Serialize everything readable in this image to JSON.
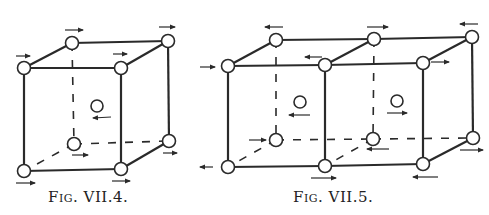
{
  "figures": [
    {
      "id": "fig-vii-4",
      "caption": "Fig. VII.4.",
      "caption_pos": [
        48,
        188
      ],
      "nodes": {
        "ftl": [
          24,
          68
        ],
        "ftr": [
          121,
          68
        ],
        "fbl": [
          24,
          171
        ],
        "fbr": [
          121,
          169
        ],
        "btl": [
          72,
          43
        ],
        "btr": [
          168,
          41
        ],
        "bbl": [
          74,
          144
        ],
        "bbr": [
          169,
          141
        ]
      },
      "center": [
        97,
        106
      ],
      "solid_edges": [
        [
          "ftl",
          "ftr"
        ],
        [
          "ftr",
          "fbr"
        ],
        [
          "fbr",
          "fbl"
        ],
        [
          "fbl",
          "ftl"
        ],
        [
          "ftl",
          "btl"
        ],
        [
          "btl",
          "btr"
        ],
        [
          "btr",
          "ftr"
        ],
        [
          "btr",
          "bbr"
        ],
        [
          "bbr",
          "fbr"
        ]
      ],
      "dashed_edges": [
        [
          "btl",
          "bbl"
        ],
        [
          "bbl",
          "bbr"
        ],
        [
          "bbl",
          "fbl"
        ]
      ],
      "arrows": [
        {
          "x1": 65,
          "y1": 30,
          "x2": 83,
          "y2": 30,
          "dir": "right"
        },
        {
          "x1": 16,
          "y1": 56,
          "x2": 30,
          "y2": 56,
          "dir": "right"
        },
        {
          "x1": 113,
          "y1": 54,
          "x2": 127,
          "y2": 54,
          "dir": "right"
        },
        {
          "x1": 159,
          "y1": 27,
          "x2": 175,
          "y2": 27,
          "dir": "right"
        },
        {
          "x1": 111,
          "y1": 117,
          "x2": 93,
          "y2": 118,
          "dir": "left"
        },
        {
          "x1": 72,
          "y1": 155,
          "x2": 88,
          "y2": 155,
          "dir": "right"
        },
        {
          "x1": 16,
          "y1": 183,
          "x2": 35,
          "y2": 183,
          "dir": "right"
        },
        {
          "x1": 112,
          "y1": 181,
          "x2": 130,
          "y2": 181,
          "dir": "right"
        },
        {
          "x1": 163,
          "y1": 153,
          "x2": 177,
          "y2": 153,
          "dir": "right"
        }
      ]
    },
    {
      "id": "fig-vii-5",
      "caption": "Fig. VII.5.",
      "caption_pos": [
        293,
        188
      ],
      "nodes": {
        "ftl": [
          228,
          66
        ],
        "ftm": [
          325,
          65
        ],
        "ftr": [
          423,
          63
        ],
        "fbl": [
          228,
          167
        ],
        "fbm": [
          325,
          166
        ],
        "fbr": [
          423,
          164
        ],
        "btl": [
          276,
          40
        ],
        "btm": [
          374,
          39
        ],
        "btr": [
          472,
          37
        ],
        "bbl": [
          276,
          140
        ],
        "bbm": [
          373,
          139
        ],
        "bbr": [
          473,
          138
        ]
      },
      "centers": [
        [
          300,
          102
        ],
        [
          397,
          101
        ]
      ],
      "solid_edges": [
        [
          "ftl",
          "ftm"
        ],
        [
          "ftm",
          "ftr"
        ],
        [
          "fbl",
          "fbm"
        ],
        [
          "fbm",
          "fbr"
        ],
        [
          "ftl",
          "fbl"
        ],
        [
          "ftm",
          "fbm"
        ],
        [
          "ftr",
          "fbr"
        ],
        [
          "ftl",
          "btl"
        ],
        [
          "ftm",
          "btm"
        ],
        [
          "ftr",
          "btr"
        ],
        [
          "btl",
          "btm"
        ],
        [
          "btm",
          "btr"
        ],
        [
          "btr",
          "bbr"
        ],
        [
          "bbr",
          "fbr"
        ]
      ],
      "dashed_edges": [
        [
          "btl",
          "bbl"
        ],
        [
          "btm",
          "bbm"
        ],
        [
          "bbl",
          "bbm"
        ],
        [
          "bbm",
          "bbr"
        ],
        [
          "bbl",
          "fbl"
        ],
        [
          "bbm",
          "fbm"
        ]
      ],
      "arrows": [
        {
          "x1": 283,
          "y1": 27,
          "x2": 265,
          "y2": 27,
          "dir": "left"
        },
        {
          "x1": 200,
          "y1": 67,
          "x2": 215,
          "y2": 67,
          "dir": "right"
        },
        {
          "x1": 322,
          "y1": 57,
          "x2": 305,
          "y2": 57,
          "dir": "left"
        },
        {
          "x1": 367,
          "y1": 27,
          "x2": 388,
          "y2": 27,
          "dir": "right"
        },
        {
          "x1": 478,
          "y1": 24,
          "x2": 460,
          "y2": 24,
          "dir": "left"
        },
        {
          "x1": 431,
          "y1": 62,
          "x2": 449,
          "y2": 62,
          "dir": "right"
        },
        {
          "x1": 310,
          "y1": 115,
          "x2": 289,
          "y2": 115,
          "dir": "left"
        },
        {
          "x1": 387,
          "y1": 113,
          "x2": 407,
          "y2": 113,
          "dir": "right"
        },
        {
          "x1": 249,
          "y1": 140,
          "x2": 266,
          "y2": 140,
          "dir": "right"
        },
        {
          "x1": 213,
          "y1": 167,
          "x2": 200,
          "y2": 167,
          "dir": "left"
        },
        {
          "x1": 311,
          "y1": 178,
          "x2": 336,
          "y2": 178,
          "dir": "right"
        },
        {
          "x1": 389,
          "y1": 149,
          "x2": 367,
          "y2": 149,
          "dir": "left"
        },
        {
          "x1": 438,
          "y1": 177,
          "x2": 413,
          "y2": 177,
          "dir": "left"
        },
        {
          "x1": 460,
          "y1": 150,
          "x2": 483,
          "y2": 150,
          "dir": "right"
        }
      ]
    }
  ],
  "style": {
    "line_color": "#2a2a2a",
    "node_fill": "#ffffff",
    "node_radius": 6.5
  }
}
